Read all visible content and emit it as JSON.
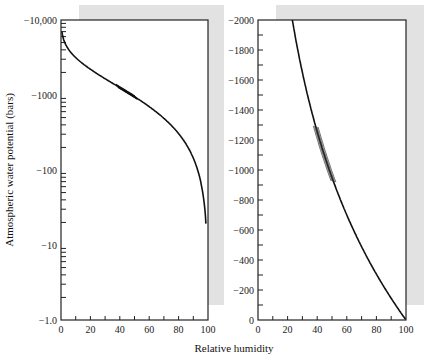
{
  "chart_data": [
    {
      "type": "line",
      "title": "",
      "xlabel": "Relative humidity",
      "ylabel": "Atmospheric water potential (bars)",
      "yscale": "log",
      "xlim": [
        0,
        100
      ],
      "ylim": [
        -1.0,
        -10000
      ],
      "x_ticks": [
        "0",
        "20",
        "40",
        "60",
        "80",
        "100"
      ],
      "y_ticks": [
        "-10,000",
        "-1000",
        "-100",
        "-10",
        "-1.0"
      ],
      "series": [
        {
          "name": "water potential",
          "x": [
            0.5,
            2,
            5,
            10,
            20,
            30,
            40,
            50,
            60,
            70,
            80,
            90,
            95,
            98,
            99
          ],
          "y": [
            -7000,
            -5300,
            -4050,
            -3100,
            -2170,
            -1620,
            -1230,
            -935,
            -690,
            -480,
            -300,
            -142,
            -69,
            -27,
            -13.5
          ]
        }
      ]
    },
    {
      "type": "line",
      "title": "",
      "xlabel": "Relative humidity",
      "ylabel": "",
      "yscale": "linear",
      "xlim": [
        0,
        100
      ],
      "ylim": [
        0,
        -2000
      ],
      "x_ticks": [
        "0",
        "20",
        "40",
        "60",
        "80",
        "100"
      ],
      "y_ticks": [
        "0",
        "-200",
        "-400",
        "-600",
        "-800",
        "-1000",
        "-1200",
        "-1400",
        "-1600",
        "-1800",
        "-2000"
      ],
      "series": [
        {
          "name": "water potential",
          "x": [
            21,
            30,
            40,
            50,
            60,
            70,
            80,
            90,
            100
          ],
          "y": [
            -2000,
            -1620,
            -1230,
            -935,
            -690,
            -480,
            -300,
            -142,
            0
          ]
        }
      ]
    }
  ],
  "labels": {
    "ylabel": "Atmospheric water potential (bars)",
    "xlabel": "Relative humidity",
    "left_y_ticks": [
      "-10,000",
      "-1000",
      "-100",
      "-10",
      "-1.0"
    ],
    "right_y_ticks": [
      "-2000",
      "-1800",
      "-1600",
      "-1400",
      "-1200",
      "-1000",
      "-800",
      "-600",
      "-400",
      "-200",
      "0"
    ],
    "x_ticks": [
      "0",
      "20",
      "40",
      "60",
      "80",
      "100"
    ]
  },
  "colors": {
    "shadow": "#e2e2e2",
    "line": "#111111",
    "axis": "#222222"
  }
}
